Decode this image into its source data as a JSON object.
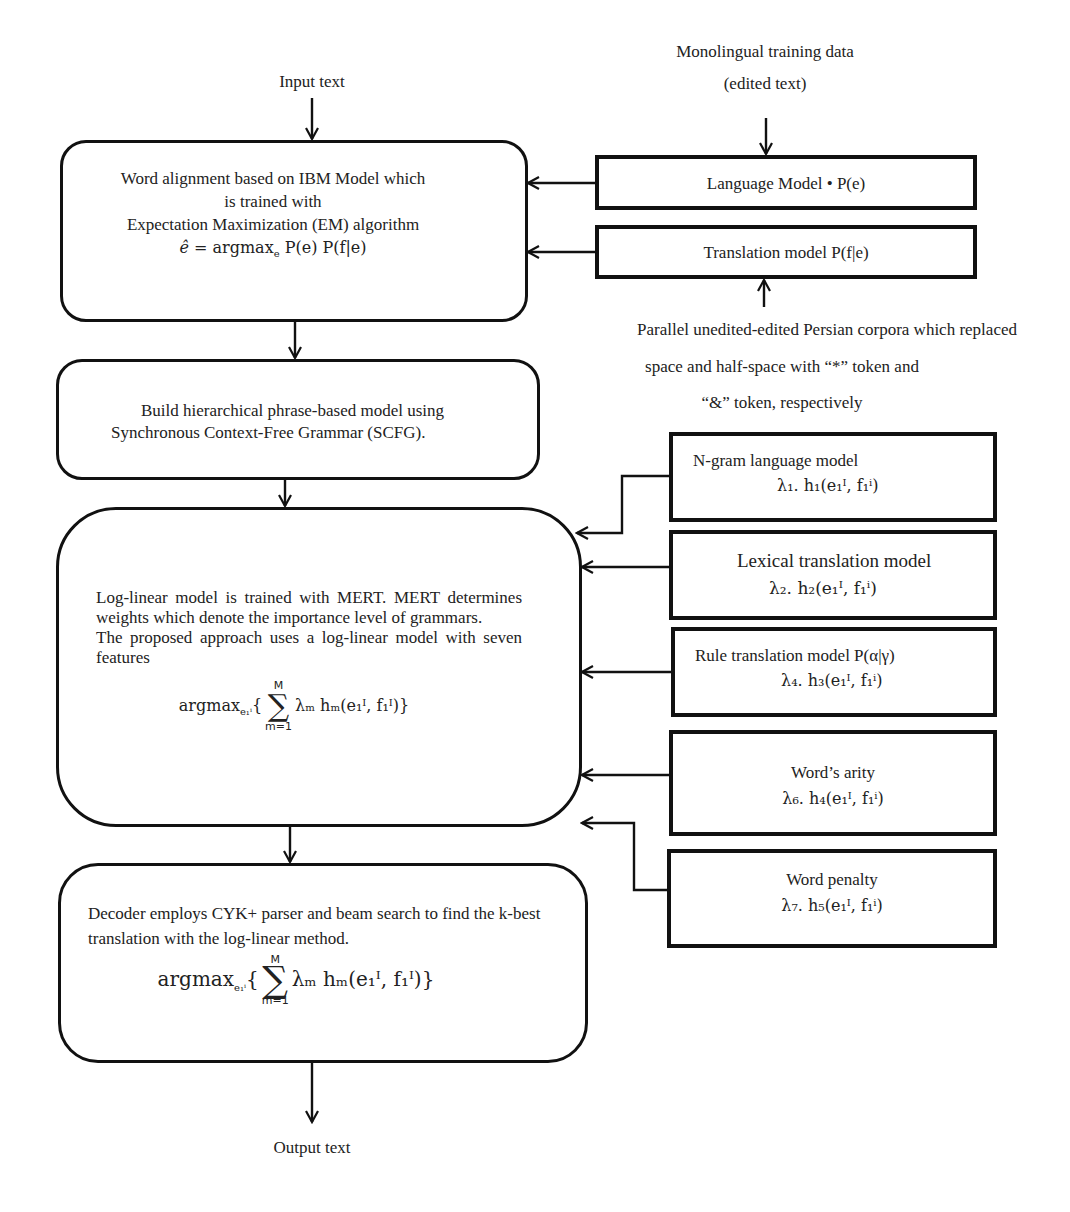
{
  "diagram": {
    "inputs": {
      "input_text": "Input text",
      "monolingual_line1": "Monolingual training data",
      "monolingual_line2": "(edited text)",
      "parallel_line1": "Parallel unedited-edited Persian corpora which replaced",
      "parallel_line2": "space and half-space with “*” token and",
      "parallel_line3": "“&” token, respectively"
    },
    "word_alignment": {
      "line1": "Word alignment based on IBM Model which",
      "line2": "is trained with",
      "line3": "Expectation Maximization (EM) algorithm",
      "formula_lhs": "ê =",
      "formula_argmax": "argmax",
      "formula_sub": "e",
      "formula_rhs": "P(e) P(f|e)"
    },
    "language_model": {
      "label": "Language Model • P(e)"
    },
    "translation_model": {
      "label": "Translation model P(f|e)"
    },
    "hierarchical": {
      "line1": "Build hierarchical phrase-based model using",
      "line2": "Synchronous Context-Free Grammar (SCFG)."
    },
    "log_linear": {
      "para1": "Log-linear model is trained with MERT. MERT determines weights which denote the importance level of grammars.",
      "para2": "The proposed approach uses a log-linear model with seven features",
      "formula_argmax": "argmax",
      "formula_sub": "e₁ⁱ",
      "sum_upper": "M",
      "sum_lower": "m=1",
      "formula_body": "λₘ hₘ(e₁ᴵ, f₁ᴵ)}"
    },
    "features": [
      {
        "title": "N-gram language model",
        "formula": "λ₁. h₁(e₁ᴵ, f₁ⁱ)"
      },
      {
        "title": "Lexical translation model",
        "formula": "λ₂. h₂(e₁ᴵ, f₁ⁱ)"
      },
      {
        "title": "Rule translation model P(α|γ)",
        "formula": "λ₄. h₃(e₁ᴵ, f₁ⁱ)"
      },
      {
        "title": "Word’s arity",
        "formula": "λ₆. h₄(e₁ᴵ, f₁ⁱ)"
      },
      {
        "title": "Word penalty",
        "formula": "λ₇. h₅(e₁ᴵ, f₁ⁱ)"
      }
    ],
    "decoder": {
      "para": "Decoder employs CYK+ parser and beam search to find the k-best translation with the log-linear method.",
      "formula_argmax": "argmax",
      "formula_sub": "e₁ⁱ",
      "sum_upper": "M",
      "sum_lower": "m=1",
      "formula_body": "λₘ hₘ(e₁ᴵ, f₁ᴵ)}"
    },
    "output_text": "Output text"
  }
}
